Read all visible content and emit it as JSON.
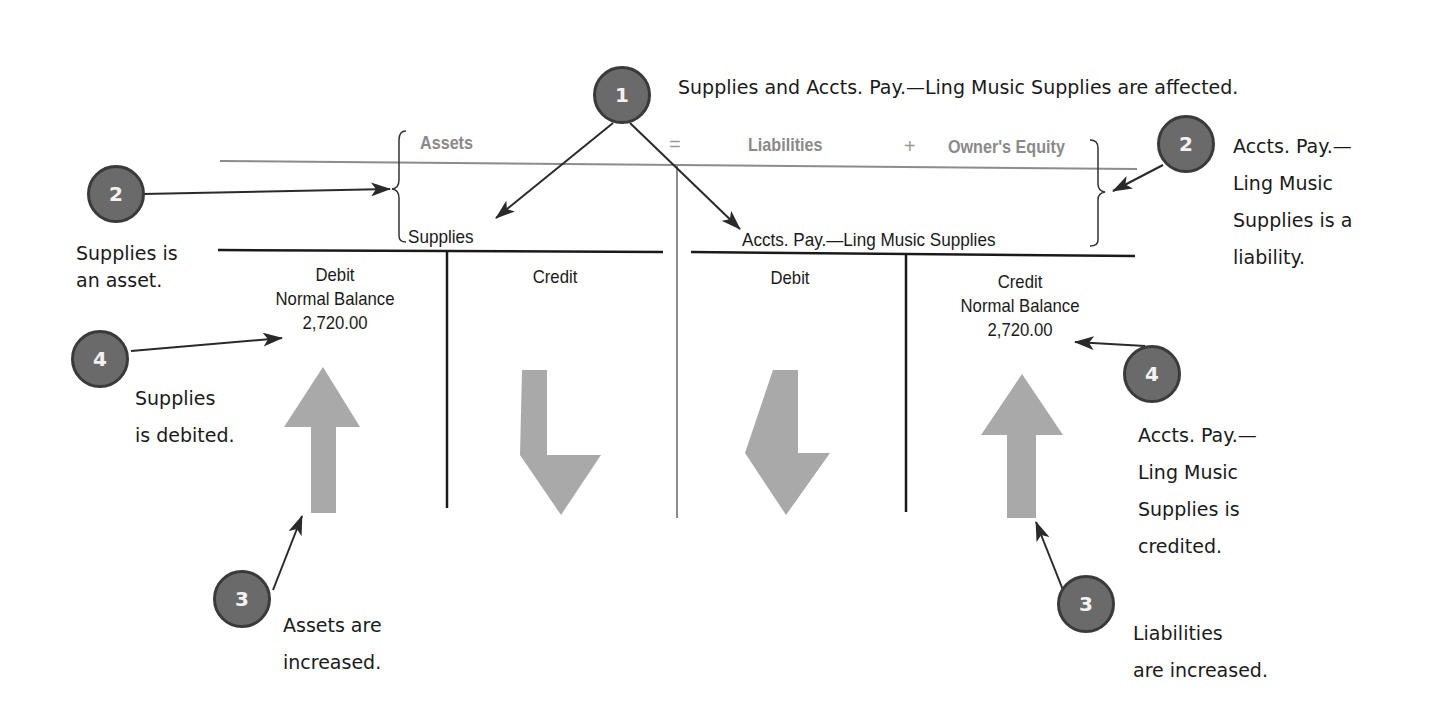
{
  "equation": {
    "assets": "Assets",
    "equals": "=",
    "liabilities": "Liabilities",
    "plus": "+",
    "owners_equity": "Owner's Equity"
  },
  "accounts": {
    "left": {
      "title": "Supplies",
      "debit_label": "Debit",
      "debit_sub": "Normal Balance",
      "debit_amount": "2,720.00",
      "credit_label": "Credit",
      "debit_arrow": "up",
      "credit_arrow": "down"
    },
    "right": {
      "title": "Accts. Pay.—Ling Music Supplies",
      "debit_label": "Debit",
      "credit_label": "Credit",
      "credit_sub": "Normal Balance",
      "credit_amount": "2,720.00",
      "debit_arrow": "down",
      "credit_arrow": "up"
    }
  },
  "callouts": {
    "step1": {
      "number": "1",
      "text": "Supplies and Accts. Pay.—Ling Music Supplies are affected."
    },
    "step2_left": {
      "number": "2",
      "lines": [
        "Supplies is",
        "an asset."
      ]
    },
    "step2_right": {
      "number": "2",
      "lines": [
        "Accts. Pay.—",
        "Ling Music",
        "Supplies is a",
        "liability."
      ]
    },
    "step3_left": {
      "number": "3",
      "lines": [
        "Assets are",
        "increased."
      ]
    },
    "step3_right": {
      "number": "3",
      "lines": [
        "Liabilities",
        "are increased."
      ]
    },
    "step4_left": {
      "number": "4",
      "lines": [
        "Supplies",
        "is debited."
      ]
    },
    "step4_right": {
      "number": "4",
      "lines": [
        "Accts. Pay.—",
        "Ling Music",
        "Supplies is",
        "credited."
      ]
    }
  },
  "colors": {
    "badge_fill": "#6a6a6a",
    "badge_border": "#3a3a3a",
    "big_arrow": "#a9a9a9",
    "header_text": "#8a8a8a",
    "line_dark": "#1a1a1a",
    "line_gray": "#8c8c8c"
  }
}
